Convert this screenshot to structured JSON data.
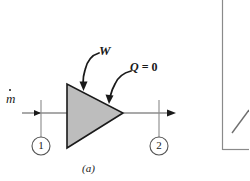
{
  "figure": {
    "caption": "(a)",
    "labels": {
      "mass_flow": "m",
      "work": "W",
      "heat": "Q = 0",
      "heat_symbol": "Q",
      "heat_value": " = 0"
    },
    "stations": [
      {
        "id": "1",
        "label": "1"
      },
      {
        "id": "2",
        "label": "2"
      }
    ],
    "colors": {
      "device_fill": "#bdbdbd",
      "device_stroke": "#1a1a1a",
      "line": "#555555",
      "text": "#1a1a1a",
      "background": "#ffffff",
      "adjacent_panel_border": "#8a8a8a"
    },
    "geometry": {
      "triangle_apex_x": 123,
      "triangle_left_x": 67,
      "triangle_top_y": 84,
      "triangle_bottom_y": 148,
      "flow_axis_y": 113,
      "inlet_arrow_x": 47,
      "outlet_arrow_x": 170
    }
  }
}
